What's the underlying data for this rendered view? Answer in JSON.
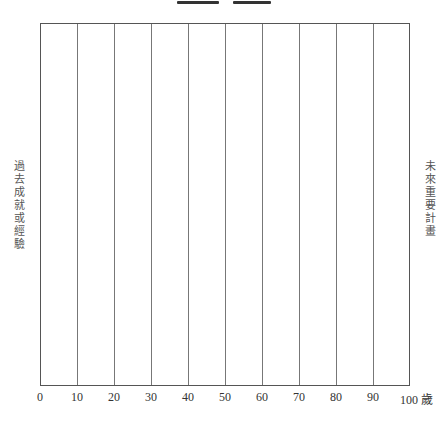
{
  "diagram": {
    "left_label": "過去成就或經驗",
    "right_label": "未來重要計畫",
    "x_axis": {
      "ticks": [
        "0",
        "10",
        "20",
        "30",
        "40",
        "50",
        "60",
        "70",
        "80",
        "90",
        "100 歲"
      ],
      "unit": "歲",
      "min": 0,
      "max": 100,
      "step": 10
    },
    "colors": {
      "grid_line": "#777777",
      "border": "#555555",
      "text": "#333333"
    }
  }
}
